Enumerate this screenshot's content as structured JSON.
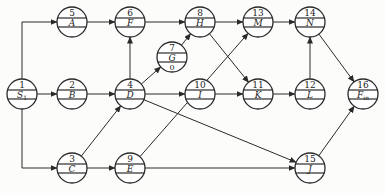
{
  "diagram": {
    "type": "activity-on-node network",
    "nodes": [
      {
        "id": "1",
        "label": "S",
        "sub": "1",
        "x": 22,
        "y": 94,
        "extra": ""
      },
      {
        "id": "5",
        "label": "A",
        "sub": "",
        "x": 72,
        "y": 22,
        "extra": ""
      },
      {
        "id": "2",
        "label": "B",
        "sub": "",
        "x": 72,
        "y": 94,
        "extra": ""
      },
      {
        "id": "3",
        "label": "C",
        "sub": "",
        "x": 72,
        "y": 168,
        "extra": ""
      },
      {
        "id": "6",
        "label": "F",
        "sub": "",
        "x": 130,
        "y": 22,
        "extra": ""
      },
      {
        "id": "4",
        "label": "D",
        "sub": "",
        "x": 130,
        "y": 94,
        "extra": ""
      },
      {
        "id": "9",
        "label": "E",
        "sub": "",
        "x": 130,
        "y": 168,
        "extra": ""
      },
      {
        "id": "7",
        "label": "G",
        "sub": "",
        "x": 172,
        "y": 57,
        "extra": "0"
      },
      {
        "id": "8",
        "label": "H",
        "sub": "",
        "x": 200,
        "y": 22,
        "extra": ""
      },
      {
        "id": "10",
        "label": "I",
        "sub": "",
        "x": 200,
        "y": 94,
        "extra": ""
      },
      {
        "id": "13",
        "label": "M",
        "sub": "",
        "x": 258,
        "y": 22,
        "extra": ""
      },
      {
        "id": "11",
        "label": "K",
        "sub": "",
        "x": 258,
        "y": 94,
        "extra": ""
      },
      {
        "id": "14",
        "label": "N",
        "sub": "",
        "x": 310,
        "y": 22,
        "extra": ""
      },
      {
        "id": "12",
        "label": "L",
        "sub": "",
        "x": 310,
        "y": 94,
        "extra": ""
      },
      {
        "id": "15",
        "label": "J",
        "sub": "",
        "x": 310,
        "y": 168,
        "extra": ""
      },
      {
        "id": "16",
        "label": "F",
        "sub": "in",
        "x": 363,
        "y": 94,
        "extra": ""
      }
    ],
    "edges": [
      {
        "from": "1",
        "to": "5",
        "route": "elbow-up"
      },
      {
        "from": "1",
        "to": "2",
        "route": "straight"
      },
      {
        "from": "1",
        "to": "3",
        "route": "elbow-down"
      },
      {
        "from": "5",
        "to": "6",
        "route": "straight"
      },
      {
        "from": "2",
        "to": "4",
        "route": "straight"
      },
      {
        "from": "3",
        "to": "4",
        "route": "straight"
      },
      {
        "from": "3",
        "to": "9",
        "route": "straight"
      },
      {
        "from": "4",
        "to": "6",
        "route": "straight"
      },
      {
        "from": "4",
        "to": "7",
        "route": "straight"
      },
      {
        "from": "4",
        "to": "10",
        "route": "straight"
      },
      {
        "from": "4",
        "to": "15",
        "route": "straight"
      },
      {
        "from": "6",
        "to": "8",
        "route": "straight"
      },
      {
        "from": "7",
        "to": "8",
        "route": "straight"
      },
      {
        "from": "9",
        "to": "13",
        "route": "straight"
      },
      {
        "from": "9",
        "to": "15",
        "route": "straight"
      },
      {
        "from": "8",
        "to": "13",
        "route": "straight"
      },
      {
        "from": "8",
        "to": "11",
        "route": "straight"
      },
      {
        "from": "10",
        "to": "11",
        "route": "straight"
      },
      {
        "from": "13",
        "to": "14",
        "route": "straight"
      },
      {
        "from": "11",
        "to": "12",
        "route": "straight"
      },
      {
        "from": "12",
        "to": "14",
        "route": "straight"
      },
      {
        "from": "14",
        "to": "16",
        "route": "straight"
      },
      {
        "from": "15",
        "to": "16",
        "route": "straight"
      }
    ],
    "style": {
      "stroke": "#2a2a2a",
      "fill": "#ffffff",
      "radius": 15
    }
  }
}
